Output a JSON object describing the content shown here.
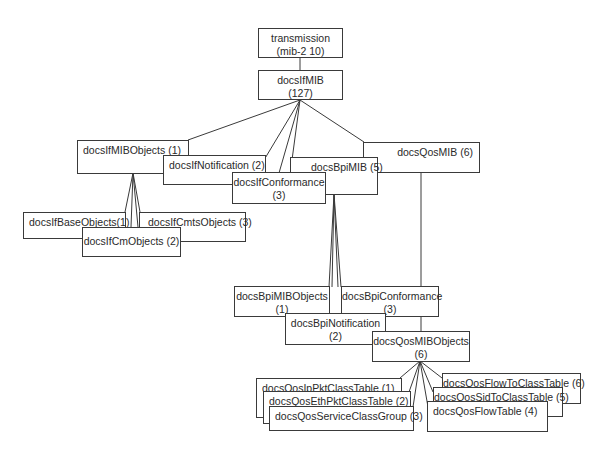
{
  "diagram": {
    "type": "tree",
    "nodes": {
      "transmission": {
        "l1": "transmission",
        "l2": "(mib-2 10)"
      },
      "docsIfMIB": {
        "l1": "docsIfMIB",
        "l2": "(127)"
      },
      "docsIfMIBObjects": {
        "l1": "docsIfMIBObjects (1)"
      },
      "docsIfNotification": {
        "l1": "docsIfNotification (2)"
      },
      "docsIfConformance": {
        "l1": "docsIfConformance",
        "l2": "(3)"
      },
      "docsBpiMIB": {
        "l1": "docsBpiMIB (5)"
      },
      "docsQosMIB": {
        "l1": "docsQosMIB (6)"
      },
      "docsIfBaseObjects": {
        "l1": "docsIfBaseObjects(1)"
      },
      "docsIfCmtsObjects": {
        "l1": "docsIfCmtsObjects (3)"
      },
      "docsIfCmObjects": {
        "l1": "docsIfCmObjects (2)"
      },
      "docsBpiMIBObjects": {
        "l1": "docsBpiMIBObjects",
        "l2": "(1)"
      },
      "docsBpiConformance": {
        "l1": "docsBpiConformance",
        "l2": "(3)"
      },
      "docsBpiNotification": {
        "l1": "docsBpiNotification",
        "l2": "(2)"
      },
      "docsQosMIBObjects": {
        "l1": "docsQosMIBObjects",
        "l2": "(6)"
      },
      "docsQosIpPktClassTable": {
        "l1": "docsQosIpPktClassTable (1)"
      },
      "docsQosEthPktClassTable": {
        "l1": "docsQosEthPktClassTable (2)"
      },
      "docsQosServiceClassGroup": {
        "l1": "docsQosServiceClassGroup (3)"
      },
      "docsQosFlowToClassTable": {
        "l1": "docsQosFlowToClassTable (6)"
      },
      "docsQosSidToClassTable": {
        "l1": "docsQosSidToClassTable (5)"
      },
      "docsQosFlowTable": {
        "l1": "docsQosFlowTable (4)"
      }
    },
    "edges": [
      [
        "transmission",
        "docsIfMIB"
      ],
      [
        "docsIfMIB",
        "docsIfMIBObjects"
      ],
      [
        "docsIfMIB",
        "docsIfNotification"
      ],
      [
        "docsIfMIB",
        "docsIfConformance"
      ],
      [
        "docsIfMIB",
        "docsBpiMIB"
      ],
      [
        "docsIfMIB",
        "docsQosMIB"
      ],
      [
        "docsIfMIBObjects",
        "docsIfBaseObjects"
      ],
      [
        "docsIfMIBObjects",
        "docsIfCmObjects"
      ],
      [
        "docsIfMIBObjects",
        "docsIfCmtsObjects"
      ],
      [
        "docsBpiMIB",
        "docsBpiMIBObjects"
      ],
      [
        "docsBpiMIB",
        "docsBpiNotification"
      ],
      [
        "docsBpiMIB",
        "docsBpiConformance"
      ],
      [
        "docsQosMIB",
        "docsQosMIBObjects"
      ],
      [
        "docsQosMIBObjects",
        "docsQosIpPktClassTable"
      ],
      [
        "docsQosMIBObjects",
        "docsQosEthPktClassTable"
      ],
      [
        "docsQosMIBObjects",
        "docsQosServiceClassGroup"
      ],
      [
        "docsQosMIBObjects",
        "docsQosFlowTable"
      ],
      [
        "docsQosMIBObjects",
        "docsQosSidToClassTable"
      ],
      [
        "docsQosMIBObjects",
        "docsQosFlowToClassTable"
      ]
    ]
  }
}
